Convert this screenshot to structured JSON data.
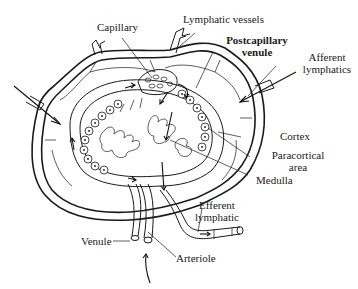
{
  "diagram": {
    "labels": {
      "capillary": "Capillary",
      "lymphatic_vessels": "Lymphatic vessels",
      "postcapillary_venule_line1": "Postcapillary",
      "postcapillary_venule_line2": "venule",
      "afferent_lymphatics_line1": "Afferent",
      "afferent_lymphatics_line2": "lymphatics",
      "cortex": "Cortex",
      "paracortical_area_line1": "Paracortical",
      "paracortical_area_line2": "area",
      "medulla": "Medulla",
      "efferent_lymphatic_line1": "Efferent",
      "efferent_lymphatic_line2": "lymphatic",
      "venule": "Venule",
      "arteriole": "Arteriole"
    },
    "colors": {
      "ink": "#1a1a1a",
      "background": "#ffffff"
    }
  }
}
